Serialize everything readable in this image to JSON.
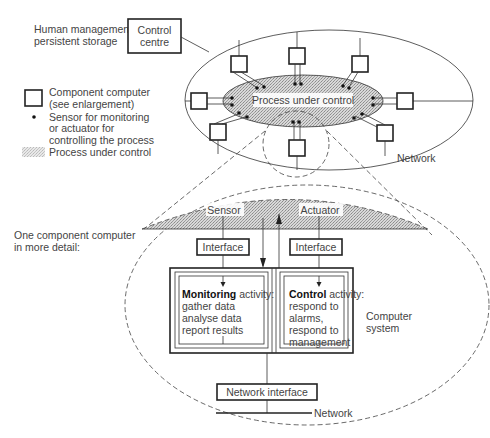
{
  "top": {
    "management_label_line1": "Human management,",
    "management_label_line2": "persistent storage",
    "control_centre_line1": "Control",
    "control_centre_line2": "centre",
    "process_label": "Process under control",
    "network_label": "Network"
  },
  "legend": {
    "component_line1": "Component computer",
    "component_line2": "(see enlargement)",
    "sensor_line1": "Sensor for monitoring",
    "sensor_line2": "or actuator for",
    "sensor_line3": "controlling the process",
    "process": "Process under control"
  },
  "detail": {
    "caption_line1": "One component computer",
    "caption_line2": "in more detail:",
    "sensor": "Sensor",
    "actuator": "Actuator",
    "interface_left": "Interface",
    "interface_right": "Interface",
    "monitoring": {
      "bold": "Monitoring",
      "rest": " activity:",
      "lines": [
        "gather data",
        "analyse data",
        "report results"
      ]
    },
    "control": {
      "bold": "Control",
      "rest": " activity:",
      "lines": [
        "respond to",
        "alarms,",
        "respond to",
        "management"
      ]
    },
    "computer_system_line1": "Computer",
    "computer_system_line2": "system",
    "network_interface": "Network interface",
    "network_label": "Network"
  },
  "colors": {
    "stipple": "#c8c8c8",
    "line": "#333333",
    "text": "#444444"
  }
}
